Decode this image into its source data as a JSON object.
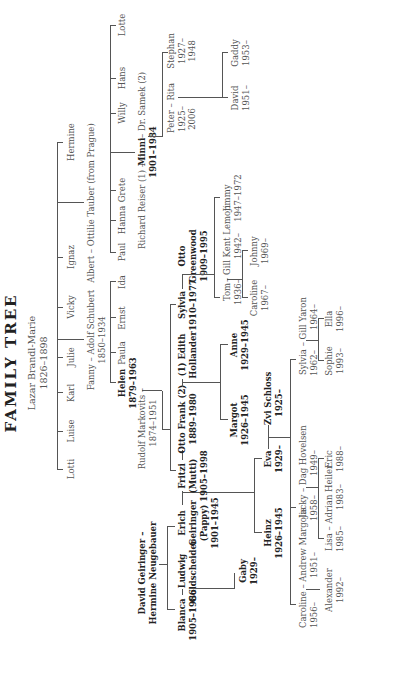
{
  "title": "FAMILY TREE",
  "root": {
    "name": "Lazar Brandl-Marie",
    "years": "1826–1898"
  },
  "gen1": [
    "Lotti",
    "Luise",
    "Karl",
    "Julie",
    "Vicky",
    "Ignaz",
    "Hermine"
  ],
  "fanny": {
    "couple": "Fanny – Adolf Schubert",
    "years": "1850–1934"
  },
  "albert": {
    "couple": "Albert – Ottilie Tauber (from Prague)"
  },
  "fanny_children": {
    "helen": "Helen",
    "helen_years": "1879–1963",
    "others": [
      "Paula",
      "Ernst",
      "Ida"
    ]
  },
  "albert_children": [
    "Paul",
    "Hanna",
    "Grete",
    "Willy",
    "Hans",
    "Lotte"
  ],
  "minni": {
    "left": "Richard Reiser (1) –",
    "name": "Minni",
    "right": "– Dr. Samek (2)",
    "years": "1901–1984"
  },
  "minni_children": {
    "peter": {
      "name": "Peter – Rita",
      "years": "1925–",
      "years2": "2006"
    },
    "stephan": {
      "name": "Stephan",
      "years": "1927–",
      "years2": "1948"
    },
    "david": {
      "name": "David",
      "years": "1951–"
    },
    "gaddy": {
      "name": "Gaddy",
      "years": "1953–"
    }
  },
  "rudolf": {
    "name": "Rudolf Markovits –",
    "years": "1874–1951"
  },
  "geiringer_parents": {
    "line1": "David Geiringer –",
    "line2": "Hermine Neugebauer"
  },
  "blanca": {
    "name": "Blanca",
    "years": "1905–1986"
  },
  "ludwig": {
    "line1": "Ludwig",
    "line2": "Goldscheider"
  },
  "erich": {
    "line1": "Erich",
    "line2": "Geiringer",
    "line3": "(Pappy)",
    "years": "1901–1945"
  },
  "gaby": {
    "name": "Gaby",
    "years": "1929–"
  },
  "fritzi": {
    "line1": "Fritzi",
    "line2": "(Mutti)",
    "years": "1905–1998"
  },
  "otto_frank": {
    "name": "Otto Frank (2)",
    "years": "1889–1980"
  },
  "edith": {
    "line1": "(1) Edith",
    "line2": "Hollander"
  },
  "margot": {
    "name": "Margot",
    "years": "1926–1945"
  },
  "anne": {
    "name": "Anne",
    "years": "1929–1945"
  },
  "sylvia": {
    "name": "Sylvia",
    "years": "1910–1977"
  },
  "otto_g": {
    "line1": "Otto",
    "line2": "Greenwood",
    "years": "1909–1995"
  },
  "tom": {
    "name": "Tom",
    "years": "1936–"
  },
  "gill_kent": {
    "name": "– Gill Kent Lemon",
    "years": "1942–"
  },
  "jimmy": {
    "name": "Jimmy",
    "years": "1947–1972"
  },
  "caroline_l": {
    "name": "Caroline",
    "years": "1967–"
  },
  "johnny": {
    "name": "Johnny",
    "years": "1969–"
  },
  "heinz": {
    "name": "Heinz",
    "years": "1926–1945"
  },
  "eva": {
    "name": "Eva",
    "years": "1929–"
  },
  "zvi": {
    "name": "Zvi Schloss",
    "years": "1925–"
  },
  "caroline_s": {
    "name": "Caroline – Andrew Margolis",
    "years1": "1956–",
    "years2": "1951–"
  },
  "jacky": {
    "name": "Jacky – Dag Hovelsen",
    "years1": "1958–",
    "years2": "1949–"
  },
  "sylvia_s": {
    "name": "Sylvia – Gill Yaron",
    "years1": "1962–",
    "years2": "1964–"
  },
  "alexander": {
    "name": "Alexander",
    "years": "1992–"
  },
  "lisa": {
    "name": "Lisa – Adrian Heiler",
    "years1": "1985–",
    "years2": "1983–"
  },
  "eric": {
    "name": "Eric",
    "years": "1988–"
  },
  "sophie": {
    "name": "Sophie",
    "years": "1993–"
  },
  "ella": {
    "name": "Ella",
    "years": "1996–"
  }
}
